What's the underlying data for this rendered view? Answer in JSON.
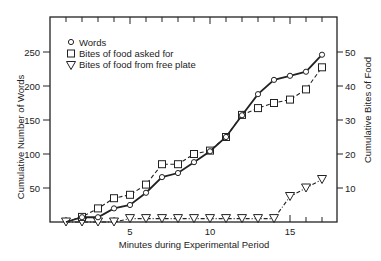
{
  "chart_data": {
    "type": "line",
    "title": "",
    "xlabel": "Minutes during Experimental Period",
    "ylabel": "Cumulative Number of Words",
    "y2label": "Cumulative Bites of Food",
    "xlim": [
      0,
      18
    ],
    "ylim": [
      0,
      290
    ],
    "y2lim": [
      0,
      58
    ],
    "x_ticks": [
      1,
      2,
      3,
      4,
      5,
      6,
      7,
      8,
      9,
      10,
      11,
      12,
      13,
      14,
      15,
      16,
      17
    ],
    "x_tick_labels": [
      {
        "value": 5,
        "label": "5"
      },
      {
        "value": 10,
        "label": "10"
      },
      {
        "value": 15,
        "label": "15"
      }
    ],
    "y_ticks": [
      {
        "value": 50,
        "label": "50"
      },
      {
        "value": 100,
        "label": "100"
      },
      {
        "value": 150,
        "label": "150"
      },
      {
        "value": 200,
        "label": "200"
      },
      {
        "value": 250,
        "label": "250"
      }
    ],
    "y2_ticks": [
      {
        "value": 10,
        "label": "10"
      },
      {
        "value": 20,
        "label": "20"
      },
      {
        "value": 30,
        "label": "30"
      },
      {
        "value": 40,
        "label": "40"
      },
      {
        "value": 50,
        "label": "50"
      }
    ],
    "grid": false,
    "legend_position": "upper-left",
    "series": [
      {
        "name": "Words",
        "marker": "circle",
        "line": "solid",
        "axis": "left",
        "x": [
          1,
          2,
          3,
          4,
          5,
          6,
          7,
          8,
          9,
          10,
          11,
          12,
          13,
          14,
          15,
          16,
          17
        ],
        "values": [
          0,
          7,
          7,
          20,
          25,
          43,
          66,
          72,
          88,
          104,
          125,
          157,
          188,
          209,
          215,
          221,
          246
        ]
      },
      {
        "name": "Bites of food asked for",
        "marker": "square",
        "line": "dashed",
        "axis": "right",
        "x": [
          1,
          2,
          3,
          4,
          5,
          6,
          7,
          8,
          9,
          10,
          11,
          12,
          13,
          14,
          15,
          16,
          17
        ],
        "values": [
          0,
          1.5,
          4,
          7,
          8,
          11,
          17,
          17,
          20,
          21,
          25,
          31.5,
          33.5,
          35,
          36,
          39,
          45.5
        ]
      },
      {
        "name": "Bites of food from free plate",
        "marker": "triangle-down",
        "line": "dash-dot",
        "axis": "right",
        "x": [
          1,
          2,
          3,
          4,
          5,
          6,
          7,
          8,
          9,
          10,
          11,
          12,
          13,
          14,
          15,
          16,
          17
        ],
        "values": [
          0,
          0,
          0,
          0,
          1,
          1,
          1,
          1,
          1,
          1,
          1,
          1,
          1,
          1,
          7.5,
          10,
          12.5
        ]
      }
    ]
  },
  "legend": {
    "words": "Words",
    "asked": "Bites of food asked for",
    "free": "Bites of food from free plate"
  },
  "axes": {
    "xlabel": "Minutes during Experimental Period",
    "ylabel": "Cumulative Number of Words",
    "y2label": "Cumulative Bites of Food"
  }
}
